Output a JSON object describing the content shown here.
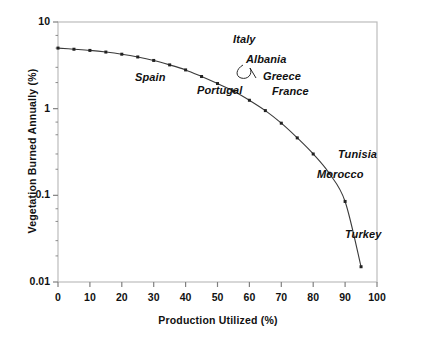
{
  "chart_data": {
    "type": "line",
    "title": "",
    "xlabel": "Production Utilized (%)",
    "ylabel": "Vegetation Burned Annually (%)",
    "xlim": [
      0,
      100
    ],
    "ylim": [
      0.01,
      10
    ],
    "yscale": "log",
    "grid": false,
    "legend": "none",
    "xticks": [
      "0",
      "10",
      "20",
      "30",
      "40",
      "50",
      "60",
      "70",
      "80",
      "90",
      "100"
    ],
    "yticks": [
      "0.01",
      "0.1",
      "1",
      "10"
    ],
    "x": [
      0,
      5,
      10,
      15,
      20,
      25,
      30,
      35,
      40,
      45,
      50,
      55,
      60,
      65,
      70,
      75,
      80,
      85,
      90,
      95
    ],
    "values": [
      5.0,
      4.85,
      4.7,
      4.5,
      4.25,
      3.95,
      3.6,
      3.2,
      2.8,
      2.35,
      1.95,
      1.6,
      1.25,
      0.95,
      0.68,
      0.46,
      0.3,
      0.18,
      0.085,
      0.015
    ],
    "marker": "square",
    "series": [
      {
        "name": "Vegetation burned vs production utilized",
        "values": [
          5.0,
          4.85,
          4.7,
          4.5,
          4.25,
          3.95,
          3.6,
          3.2,
          2.8,
          2.35,
          1.95,
          1.6,
          1.25,
          0.95,
          0.68,
          0.46,
          0.3,
          0.18,
          0.085,
          0.015
        ]
      }
    ],
    "annotations": [
      {
        "label": "Italy",
        "x_px": 233,
        "y_px": 33
      },
      {
        "label": "Albania",
        "x_px": 246,
        "y_px": 53
      },
      {
        "label": "Greece",
        "x_px": 263,
        "y_px": 70
      },
      {
        "label": "Spain",
        "x_px": 135,
        "y_px": 71
      },
      {
        "label": "Portugal",
        "x_px": 197,
        "y_px": 84
      },
      {
        "label": "France",
        "x_px": 272,
        "y_px": 85
      },
      {
        "label": "Tunisia",
        "x_px": 338,
        "y_px": 148
      },
      {
        "label": "Morocco",
        "x_px": 317,
        "y_px": 168
      },
      {
        "label": "Turkey",
        "x_px": 345,
        "y_px": 228
      }
    ]
  },
  "style": {
    "curve_color": "#3a3a3a",
    "marker_color": "#222222",
    "frame_color": "#b9b9b9",
    "tick_color": "#808080",
    "text_color": "#111111",
    "background": "#ffffff"
  }
}
